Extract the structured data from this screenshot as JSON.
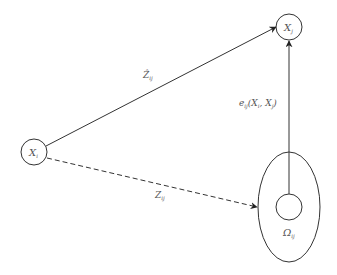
{
  "diagram": {
    "nodes": [
      {
        "id": "Xi",
        "label": "X",
        "sub": "i",
        "cx": 34,
        "cy": 152,
        "r": 13
      },
      {
        "id": "Xj",
        "label": "X",
        "sub": "j",
        "cx": 289,
        "cy": 27,
        "r": 13
      },
      {
        "id": "Omega",
        "label": "Ω",
        "sub": "ij",
        "cx": 289,
        "cy": 207,
        "r": 13
      }
    ],
    "region": {
      "id": "ellipse",
      "cx": 289,
      "cy": 207,
      "rx": 31,
      "ry": 55
    },
    "edges": [
      {
        "from": "Xi",
        "to": "Xj",
        "style": "solid",
        "label": "Ẑ",
        "label_sub": "ij"
      },
      {
        "from": "Xi",
        "to": "ellipse",
        "style": "dashed",
        "label": "Z",
        "label_sub": "ij"
      },
      {
        "from": "Omega",
        "to": "Xj",
        "style": "solid",
        "label": "e",
        "label_sub": "ij",
        "label_rest": "(X",
        "label_rest_sub1": "i",
        "label_mid": ", X",
        "label_rest_sub2": "j",
        "label_end": ")"
      }
    ],
    "colors": {
      "stroke": "#333333",
      "text": "#555555",
      "background": "#ffffff"
    }
  }
}
